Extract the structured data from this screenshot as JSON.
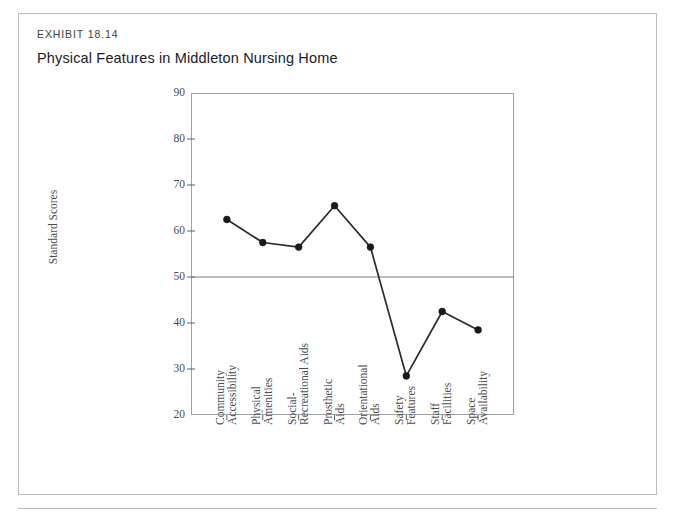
{
  "exhibit": {
    "number": "EXHIBIT 18.14",
    "title": "Physical Features in Middleton Nursing Home"
  },
  "source": {
    "text": ""
  },
  "colors": {
    "card_border": "#b9bcbf",
    "plot_border": "#9ea1a5",
    "line": "#2b2b2b",
    "marker": "#1a1a1a",
    "reference_line": "#6e7174",
    "text": "#4a4d50",
    "title_text": "#202124"
  },
  "chart_data": {
    "type": "line",
    "title": "Physical Features in Middleton Nursing Home",
    "xlabel": "",
    "ylabel": "Standard Scores",
    "ylim": [
      20,
      90
    ],
    "yticks": [
      20,
      30,
      40,
      50,
      60,
      70,
      80,
      90
    ],
    "grid": false,
    "legend": null,
    "reference_line": 50,
    "categories": [
      "Community Accessibility",
      "Physical Amenities",
      "Social-Recreational Aids",
      "Prosthetic Aids",
      "Orientational Aids",
      "Safety Features",
      "Staff Facilities",
      "Space Availability"
    ],
    "category_lines": [
      [
        "Community",
        "Accessibility"
      ],
      [
        "Physical",
        "Amenities"
      ],
      [
        "Social-",
        "Recreational Aids"
      ],
      [
        "Prosthetic",
        "Aids"
      ],
      [
        "Orientational",
        "Aids"
      ],
      [
        "Safety",
        "Features"
      ],
      [
        "Staff",
        "Facilities"
      ],
      [
        "Space",
        "Availability"
      ]
    ],
    "values": [
      62.5,
      57.5,
      56.5,
      65.5,
      56.5,
      28.5,
      42.5,
      38.5
    ]
  }
}
